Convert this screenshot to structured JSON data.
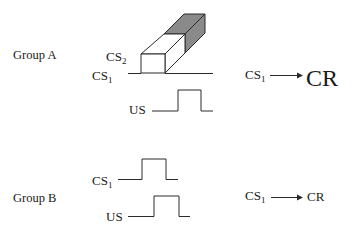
{
  "colors": {
    "line": "#2a2a2a",
    "face_white": "#ffffff",
    "face_dark": "#8a8a8a",
    "text": "#1a1a1a"
  },
  "group_a": {
    "label": "Group A",
    "signals": {
      "cs2": {
        "base": "CS",
        "sub": "2"
      },
      "cs1": {
        "base": "CS",
        "sub": "1"
      },
      "us": {
        "base": "US"
      }
    },
    "result": {
      "stimulus": {
        "base": "CS",
        "sub": "1"
      },
      "arrow": "right-arrow",
      "response": "CR",
      "response_size": "large"
    },
    "figure": "cs2-block-3d-overshadowing"
  },
  "group_b": {
    "label": "Group B",
    "signals": {
      "cs1": {
        "base": "CS",
        "sub": "1"
      },
      "us": {
        "base": "US"
      }
    },
    "result": {
      "stimulus": {
        "base": "CS",
        "sub": "1"
      },
      "arrow": "right-arrow",
      "response": "CR",
      "response_size": "normal"
    }
  }
}
